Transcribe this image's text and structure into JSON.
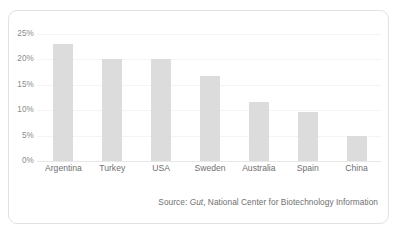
{
  "card": {
    "background_color": "#ffffff",
    "border_color": "#e2e2e2"
  },
  "source_note": {
    "prefix": "Source: ",
    "journal": "Gut",
    "suffix": ", National Center for Biotechnology Information"
  },
  "chart_data": {
    "type": "bar",
    "title": "",
    "xlabel": "",
    "ylabel": "",
    "categories": [
      "Argentina",
      "Turkey",
      "USA",
      "Sweden",
      "Australia",
      "Spain",
      "China"
    ],
    "values": [
      23,
      20,
      20,
      16.7,
      11.6,
      9.6,
      4.9
    ],
    "ylim": [
      0,
      25
    ],
    "yticks": [
      0,
      5,
      10,
      15,
      20,
      25
    ],
    "ytick_labels": [
      "0%",
      "5%",
      "10%",
      "15%",
      "20%",
      "25%"
    ],
    "grid": true,
    "legend": "none",
    "bar_color": "#dcdcdc",
    "axis_text_color": "#8b8b8b"
  }
}
